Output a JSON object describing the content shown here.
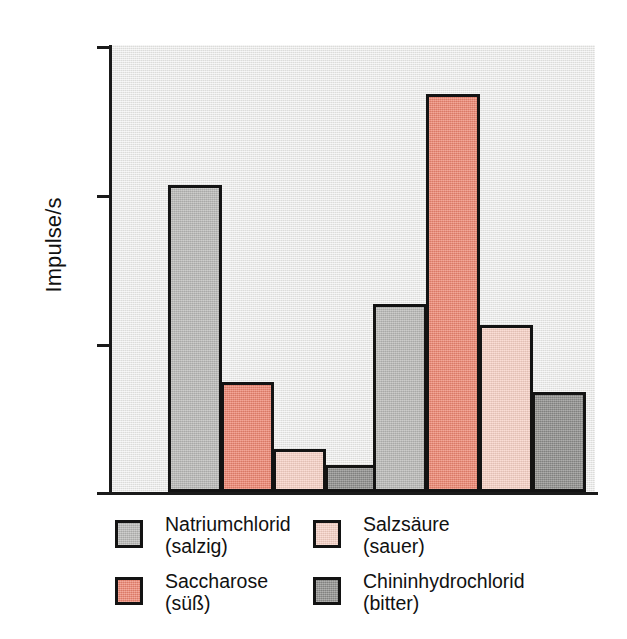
{
  "chart_data": {
    "type": "bar",
    "title": "",
    "subtitle": "",
    "xlabel": "",
    "ylabel": "Impulse/s",
    "ylim": [
      0,
      150
    ],
    "yticks": [
      0,
      50,
      100,
      150
    ],
    "ytick_labels": [
      "0",
      "50",
      "100",
      "150"
    ],
    "grid": false,
    "legend_position": "below-plot",
    "categories": [
      "Gruppe 1",
      "Gruppe 2"
    ],
    "series": [
      {
        "name": "Natriumchlorid (salzig)",
        "label_main": "Natriumchlorid",
        "label_sub": "(salzig)",
        "color": "#b9b9b7",
        "values": [
          103,
          63
        ]
      },
      {
        "name": "Saccharose (süß)",
        "label_main": "Saccharose",
        "label_sub": "(süß)",
        "color": "#ee8570",
        "values": [
          37,
          133.5
        ]
      },
      {
        "name": "Salzsäure (sauer)",
        "label_main": "Salzsäure",
        "label_sub": "(sauer)",
        "color": "#f8d2c6",
        "values": [
          14.5,
          56
        ]
      },
      {
        "name": "Chininhydrochlorid (bitter)",
        "label_main": "Chininhydrochlorid",
        "label_sub": "(bitter)",
        "color": "#8d8d8b",
        "values": [
          9,
          33.5
        ]
      }
    ]
  },
  "axis": {
    "ylabel": "Impulse/s",
    "ytick_150": "150",
    "ytick_100": "100",
    "ytick_50": "50",
    "ytick_0": "0"
  },
  "legend": {
    "items": [
      {
        "main": "Natriumchlorid",
        "sub": "(salzig)",
        "color": "#b9b9b7"
      },
      {
        "main": "Salzsäure",
        "sub": "(sauer)",
        "color": "#f8d2c6"
      },
      {
        "main": "Saccharose",
        "sub": "(süß)",
        "color": "#ee8570"
      },
      {
        "main": "Chininhydrochlorid",
        "sub": "(bitter)",
        "color": "#8d8d8b"
      }
    ]
  },
  "colors": {
    "plot_background": "#e8e8e6",
    "axis": "#131313",
    "page_background": "#ffffff",
    "gray_light": "#b9b9b7",
    "salmon": "#ee8570",
    "pink": "#f8d2c6",
    "gray_dark": "#8d8d8b"
  }
}
